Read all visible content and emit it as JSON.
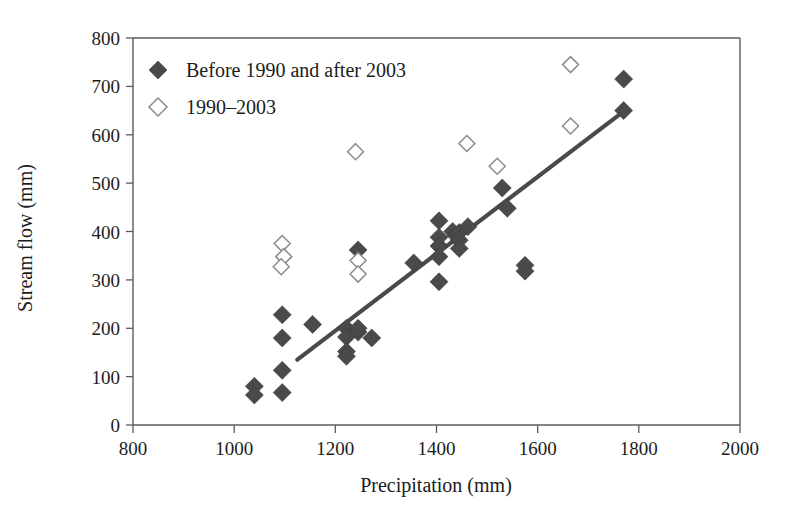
{
  "chart_data": {
    "type": "scatter",
    "title": "",
    "xlabel": "Precipitation (mm)",
    "ylabel": "Stream flow (mm)",
    "xlim": [
      800,
      2000
    ],
    "ylim": [
      0,
      800
    ],
    "xticks": [
      800,
      1000,
      1200,
      1400,
      1600,
      1800,
      2000
    ],
    "yticks": [
      0,
      100,
      200,
      300,
      400,
      500,
      600,
      700,
      800
    ],
    "grid": false,
    "legend_position": "top-left",
    "colors": {
      "filled_marker": "#4a4a4a",
      "open_marker_stroke": "#8c8c8c",
      "open_marker_fill": "#ffffff",
      "trend_line": "#4a4a4a",
      "axis": "#5a5a5a"
    },
    "series": [
      {
        "name": "Before 1990 and after 2003",
        "marker": "filled-diamond",
        "points": [
          [
            1040,
            80
          ],
          [
            1040,
            62
          ],
          [
            1095,
            228
          ],
          [
            1095,
            180
          ],
          [
            1095,
            113
          ],
          [
            1095,
            67
          ],
          [
            1155,
            208
          ],
          [
            1222,
            200
          ],
          [
            1222,
            182
          ],
          [
            1222,
            152
          ],
          [
            1222,
            142
          ],
          [
            1245,
            362
          ],
          [
            1245,
            192
          ],
          [
            1245,
            200
          ],
          [
            1272,
            180
          ],
          [
            1355,
            335
          ],
          [
            1405,
            422
          ],
          [
            1405,
            388
          ],
          [
            1405,
            370
          ],
          [
            1405,
            348
          ],
          [
            1405,
            296
          ],
          [
            1432,
            400
          ],
          [
            1438,
            392
          ],
          [
            1445,
            398
          ],
          [
            1445,
            382
          ],
          [
            1445,
            365
          ],
          [
            1462,
            410
          ],
          [
            1530,
            490
          ],
          [
            1540,
            448
          ],
          [
            1575,
            330
          ],
          [
            1575,
            318
          ],
          [
            1770,
            715
          ],
          [
            1770,
            650
          ]
        ]
      },
      {
        "name": "1990–2003",
        "marker": "open-diamond",
        "points": [
          [
            1095,
            375
          ],
          [
            1098,
            348
          ],
          [
            1093,
            327
          ],
          [
            1240,
            565
          ],
          [
            1245,
            340
          ],
          [
            1245,
            312
          ],
          [
            1460,
            582
          ],
          [
            1520,
            535
          ],
          [
            1665,
            745
          ],
          [
            1665,
            618
          ]
        ]
      }
    ],
    "trend_line": {
      "x0": 1125,
      "y0": 135,
      "x1": 1772,
      "y1": 650
    }
  },
  "legend": {
    "items": [
      {
        "label": "Before 1990 and after 2003",
        "marker": "filled-diamond-icon"
      },
      {
        "label": "1990–2003",
        "marker": "open-diamond-icon"
      }
    ]
  },
  "axis_labels": {
    "x": "Precipitation (mm)",
    "y": "Stream flow (mm)"
  },
  "tick_labels": {
    "x": [
      "800",
      "1000",
      "1200",
      "1400",
      "1600",
      "1800",
      "2000"
    ],
    "y": [
      "0",
      "100",
      "200",
      "300",
      "400",
      "500",
      "600",
      "700",
      "800"
    ]
  }
}
